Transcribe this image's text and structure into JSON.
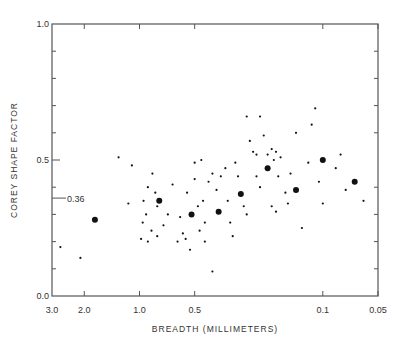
{
  "chart_data": {
    "type": "scatter",
    "title": "",
    "xlabel": "BREADTH (MILLIMETERS)",
    "ylabel": "COREY SHAPE FACTOR",
    "x_scale": "log",
    "x_reversed": true,
    "xlim": [
      3.0,
      0.05
    ],
    "ylim": [
      0.0,
      1.0
    ],
    "x_ticks": [
      {
        "value": 3.0,
        "label": "3.0"
      },
      {
        "value": 2.0,
        "label": "2.0"
      },
      {
        "value": 1.0,
        "label": "1.0"
      },
      {
        "value": 0.5,
        "label": "0.5"
      },
      {
        "value": 0.1,
        "label": "0.1"
      },
      {
        "value": 0.05,
        "label": "0.05"
      }
    ],
    "y_ticks": [
      {
        "value": 0.0,
        "label": "0.0"
      },
      {
        "value": 0.5,
        "label": "0.5"
      },
      {
        "value": 1.0,
        "label": "1.0"
      }
    ],
    "y_minor_ticks": [
      0.1,
      0.2,
      0.3,
      0.4,
      0.6,
      0.7,
      0.8,
      0.9
    ],
    "annotations": [
      {
        "type": "reference-tick",
        "y": 0.36,
        "label": "0.36"
      }
    ],
    "grid": false,
    "legend": null,
    "series": [
      {
        "name": "mean values (large dots)",
        "marker": "large",
        "points": [
          {
            "x": 1.75,
            "y": 0.28
          },
          {
            "x": 0.78,
            "y": 0.35
          },
          {
            "x": 0.52,
            "y": 0.3
          },
          {
            "x": 0.37,
            "y": 0.31
          },
          {
            "x": 0.28,
            "y": 0.375
          },
          {
            "x": 0.2,
            "y": 0.47
          },
          {
            "x": 0.14,
            "y": 0.39
          },
          {
            "x": 0.1,
            "y": 0.5
          },
          {
            "x": 0.067,
            "y": 0.42
          }
        ]
      },
      {
        "name": "individual particles (small dots)",
        "marker": "small",
        "points": [
          {
            "x": 2.7,
            "y": 0.18
          },
          {
            "x": 2.1,
            "y": 0.14
          },
          {
            "x": 1.3,
            "y": 0.51
          },
          {
            "x": 1.1,
            "y": 0.48
          },
          {
            "x": 1.15,
            "y": 0.34
          },
          {
            "x": 0.95,
            "y": 0.35
          },
          {
            "x": 0.9,
            "y": 0.4
          },
          {
            "x": 0.85,
            "y": 0.45
          },
          {
            "x": 0.82,
            "y": 0.38
          },
          {
            "x": 0.8,
            "y": 0.33
          },
          {
            "x": 0.92,
            "y": 0.3
          },
          {
            "x": 0.96,
            "y": 0.27
          },
          {
            "x": 0.98,
            "y": 0.21
          },
          {
            "x": 0.9,
            "y": 0.2
          },
          {
            "x": 0.86,
            "y": 0.24
          },
          {
            "x": 0.8,
            "y": 0.22
          },
          {
            "x": 0.74,
            "y": 0.26
          },
          {
            "x": 0.7,
            "y": 0.3
          },
          {
            "x": 0.66,
            "y": 0.41
          },
          {
            "x": 0.6,
            "y": 0.29
          },
          {
            "x": 0.58,
            "y": 0.23
          },
          {
            "x": 0.62,
            "y": 0.2
          },
          {
            "x": 0.56,
            "y": 0.21
          },
          {
            "x": 0.53,
            "y": 0.17
          },
          {
            "x": 0.55,
            "y": 0.38
          },
          {
            "x": 0.5,
            "y": 0.49
          },
          {
            "x": 0.46,
            "y": 0.5
          },
          {
            "x": 0.5,
            "y": 0.43
          },
          {
            "x": 0.48,
            "y": 0.33
          },
          {
            "x": 0.45,
            "y": 0.35
          },
          {
            "x": 0.44,
            "y": 0.27
          },
          {
            "x": 0.47,
            "y": 0.24
          },
          {
            "x": 0.44,
            "y": 0.2
          },
          {
            "x": 0.4,
            "y": 0.45
          },
          {
            "x": 0.42,
            "y": 0.42
          },
          {
            "x": 0.38,
            "y": 0.39
          },
          {
            "x": 0.36,
            "y": 0.44
          },
          {
            "x": 0.34,
            "y": 0.47
          },
          {
            "x": 0.33,
            "y": 0.35
          },
          {
            "x": 0.32,
            "y": 0.27
          },
          {
            "x": 0.3,
            "y": 0.49
          },
          {
            "x": 0.29,
            "y": 0.44
          },
          {
            "x": 0.4,
            "y": 0.09
          },
          {
            "x": 0.31,
            "y": 0.22
          },
          {
            "x": 0.27,
            "y": 0.33
          },
          {
            "x": 0.26,
            "y": 0.3
          },
          {
            "x": 0.25,
            "y": 0.57
          },
          {
            "x": 0.24,
            "y": 0.53
          },
          {
            "x": 0.26,
            "y": 0.66
          },
          {
            "x": 0.23,
            "y": 0.52
          },
          {
            "x": 0.22,
            "y": 0.66
          },
          {
            "x": 0.21,
            "y": 0.59
          },
          {
            "x": 0.23,
            "y": 0.44
          },
          {
            "x": 0.22,
            "y": 0.4
          },
          {
            "x": 0.2,
            "y": 0.52
          },
          {
            "x": 0.19,
            "y": 0.54
          },
          {
            "x": 0.18,
            "y": 0.53
          },
          {
            "x": 0.185,
            "y": 0.5
          },
          {
            "x": 0.17,
            "y": 0.51
          },
          {
            "x": 0.175,
            "y": 0.44
          },
          {
            "x": 0.19,
            "y": 0.33
          },
          {
            "x": 0.18,
            "y": 0.31
          },
          {
            "x": 0.16,
            "y": 0.38
          },
          {
            "x": 0.155,
            "y": 0.34
          },
          {
            "x": 0.14,
            "y": 0.6
          },
          {
            "x": 0.15,
            "y": 0.45
          },
          {
            "x": 0.13,
            "y": 0.25
          },
          {
            "x": 0.12,
            "y": 0.49
          },
          {
            "x": 0.115,
            "y": 0.63
          },
          {
            "x": 0.11,
            "y": 0.69
          },
          {
            "x": 0.105,
            "y": 0.42
          },
          {
            "x": 0.1,
            "y": 0.34
          },
          {
            "x": 0.085,
            "y": 0.47
          },
          {
            "x": 0.08,
            "y": 0.52
          },
          {
            "x": 0.075,
            "y": 0.39
          },
          {
            "x": 0.06,
            "y": 0.35
          }
        ]
      }
    ]
  }
}
